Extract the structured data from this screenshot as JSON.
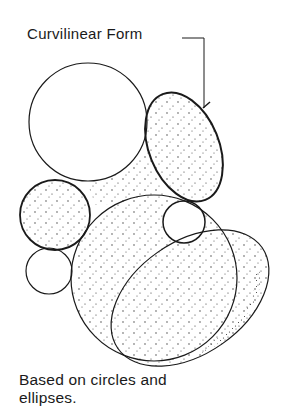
{
  "diagram": {
    "title_label": "Curvilinear Form",
    "caption": {
      "line1": "Based on circles and",
      "line2": "ellipses."
    },
    "colors": {
      "ink": "#1a1a1a",
      "background": "#ffffff",
      "stipple": "#333333"
    },
    "shapes": [
      {
        "type": "circle",
        "name": "large-upper-circle",
        "cx": 88,
        "cy": 122,
        "r": 59,
        "stippled": false
      },
      {
        "type": "ellipse",
        "name": "upper-right-ellipse",
        "cx": 184,
        "cy": 147,
        "rx": 35,
        "ry": 57,
        "rotate": -22,
        "stippled": true
      },
      {
        "type": "circle",
        "name": "left-stippled-circle",
        "cx": 55,
        "cy": 215,
        "r": 35,
        "stippled": true
      },
      {
        "type": "circle",
        "name": "small-lower-left-circle",
        "cx": 49,
        "cy": 271,
        "r": 23,
        "stippled": false
      },
      {
        "type": "circle",
        "name": "small-right-circle",
        "cx": 184,
        "cy": 222,
        "r": 21,
        "stippled": false
      },
      {
        "type": "circle",
        "name": "large-lower-circle",
        "cx": 154,
        "cy": 278,
        "r": 83,
        "stippled": true
      },
      {
        "type": "ellipse",
        "name": "lower-tilted-ellipse",
        "cx": 190,
        "cy": 298,
        "rx": 88,
        "ry": 56,
        "rotate": -35,
        "stippled": true
      }
    ]
  }
}
